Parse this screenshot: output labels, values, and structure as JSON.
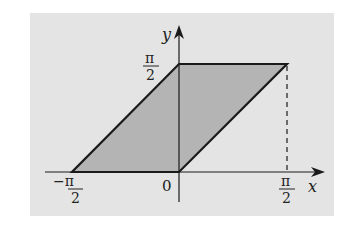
{
  "figure": {
    "background_color": "#e4e4e4",
    "fill_color": "#b4b4b4",
    "stroke_color": "#1a1a1a",
    "axes": {
      "x_label": "x",
      "y_label": "y",
      "origin_label": "0"
    },
    "ticks": {
      "x_neg": {
        "num": "−π",
        "den": "2"
      },
      "x_pos": {
        "num": "π",
        "den": "2"
      },
      "y_pos": {
        "num": "π",
        "den": "2"
      }
    },
    "shape": {
      "type": "parallelogram",
      "vertices": [
        [
          "-π/2",
          "0"
        ],
        [
          "0",
          "0"
        ],
        [
          "π/2",
          "π/2"
        ],
        [
          "0",
          "π/2"
        ]
      ]
    },
    "dashed_line": {
      "x": "π/2",
      "from_y": "0",
      "to_y": "π/2"
    }
  }
}
